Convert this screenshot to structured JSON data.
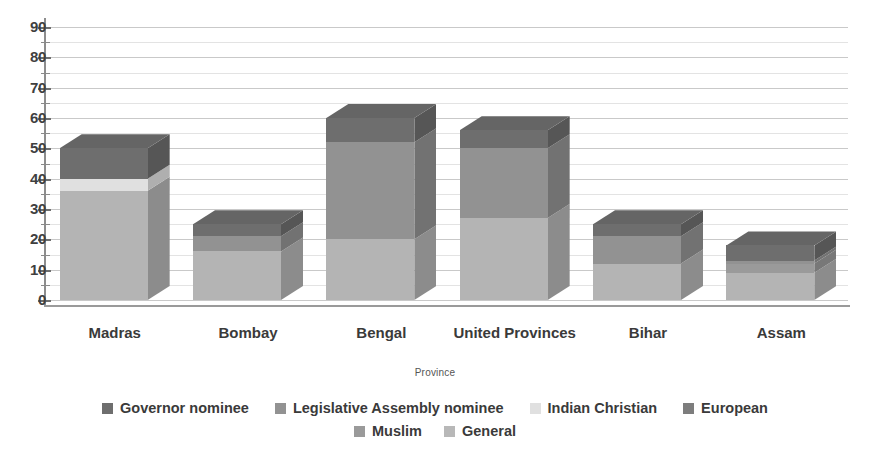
{
  "chart_data": {
    "type": "bar",
    "title": "",
    "xlabel": "Province",
    "ylabel": "",
    "ylim": [
      0,
      90
    ],
    "ytick_step": 10,
    "yticks": [
      "0",
      "10",
      "20",
      "30",
      "40",
      "50",
      "60",
      "70",
      "80",
      "90"
    ],
    "grid": true,
    "stacked": true,
    "three_d": true,
    "legend_position": "bottom",
    "categories": [
      "Madras",
      "Bombay",
      "Bengal",
      "United Provinces",
      "Bihar",
      "Assam"
    ],
    "series": [
      {
        "name": "General",
        "color": "#b4b4b4",
        "values": [
          36,
          16,
          20,
          27,
          12,
          9
        ]
      },
      {
        "name": "Muslim",
        "color": "#9a9a9a",
        "values": [
          0,
          0,
          0,
          0,
          0,
          3
        ]
      },
      {
        "name": "Indian Christian",
        "color": "#e0e0e0",
        "values": [
          4,
          0,
          0,
          0,
          0,
          0
        ]
      },
      {
        "name": "Legislative Assembly nominee",
        "color": "#929292",
        "values": [
          0,
          5,
          32,
          23,
          9,
          1
        ]
      },
      {
        "name": "Governor nominee",
        "color": "#6e6e6e",
        "values": [
          10,
          4,
          8,
          6,
          4,
          5
        ]
      },
      {
        "name": "European",
        "color": "#7d7d7d",
        "values": [
          0,
          0,
          0,
          0,
          0,
          0
        ]
      }
    ],
    "totals": [
      50,
      25,
      60,
      56,
      25,
      18
    ],
    "annotations": []
  },
  "axis": {
    "x_title": "Province",
    "y_labels": [
      "90",
      "80",
      "70",
      "60",
      "50",
      "40",
      "30",
      "20",
      "10",
      "0"
    ]
  },
  "legend": {
    "row1": [
      {
        "label": "Governor nominee",
        "color": "#6e6e6e"
      },
      {
        "label": "Legislative Assembly nominee",
        "color": "#929292"
      },
      {
        "label": "Indian Christian",
        "color": "#e0e0e0"
      },
      {
        "label": "European",
        "color": "#7d7d7d"
      }
    ],
    "row2": [
      {
        "label": "Muslim",
        "color": "#9a9a9a"
      },
      {
        "label": "General",
        "color": "#b8b8b8"
      }
    ]
  }
}
